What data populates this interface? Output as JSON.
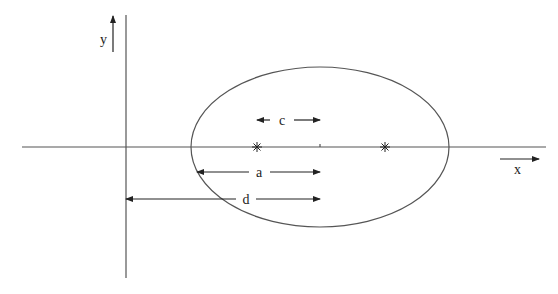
{
  "diagram": {
    "type": "ellipse-geometry",
    "axes": {
      "x_label": "x",
      "y_label": "y"
    },
    "ellipse": {
      "center": [
        320,
        147
      ],
      "rx": 129,
      "ry": 80,
      "foci": [
        [
          257,
          147
        ],
        [
          385,
          147
        ]
      ],
      "focus_marker": "asterisk"
    },
    "dimensions": [
      {
        "label": "c",
        "meaning": "center to focus",
        "from_x": 257,
        "to_x": 320,
        "y": 120
      },
      {
        "label": "a",
        "meaning": "vertex to center",
        "from_x": 197,
        "to_x": 320,
        "y": 172
      },
      {
        "label": "d",
        "meaning": "y-axis to center",
        "from_x": 126,
        "to_x": 320,
        "y": 199
      }
    ],
    "colors": {
      "line": "#555555",
      "text": "#222222",
      "background": "#ffffff"
    }
  }
}
